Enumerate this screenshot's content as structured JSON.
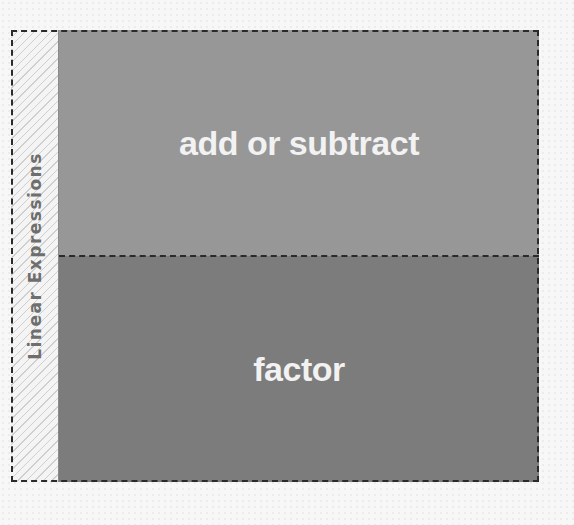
{
  "diagram": {
    "side_label": "Linear Expressions",
    "sections": [
      {
        "label": "add or subtract",
        "color": "#979797"
      },
      {
        "label": "factor",
        "color": "#7c7c7c"
      }
    ]
  }
}
